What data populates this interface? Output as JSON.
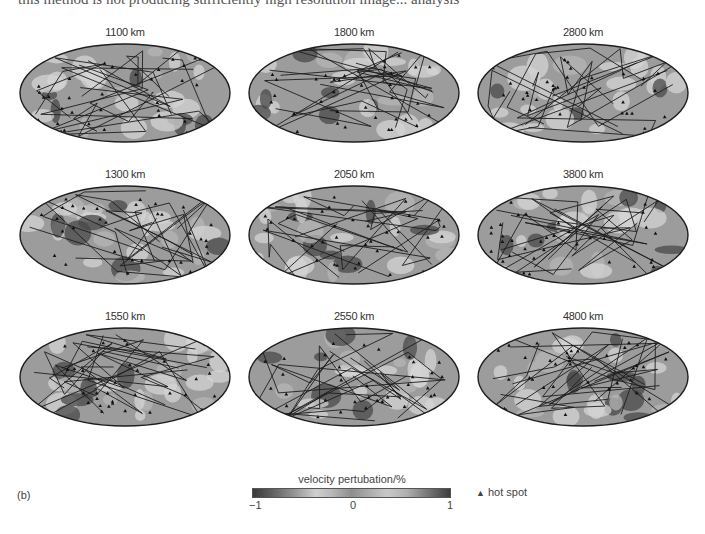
{
  "top_text": "this method is not producing sufficiently high resolution image... analysis",
  "panels": [
    {
      "label": "1100 km",
      "col": 0,
      "row": 0
    },
    {
      "label": "1800 km",
      "col": 1,
      "row": 0
    },
    {
      "label": "2800 km",
      "col": 2,
      "row": 0
    },
    {
      "label": "1300 km",
      "col": 0,
      "row": 1
    },
    {
      "label": "2050 km",
      "col": 1,
      "row": 1
    },
    {
      "label": "3800 km",
      "col": 2,
      "row": 1
    },
    {
      "label": "1550 km",
      "col": 0,
      "row": 2
    },
    {
      "label": "2550 km",
      "col": 1,
      "row": 2
    },
    {
      "label": "4800 km",
      "col": 2,
      "row": 2
    }
  ],
  "figure_label": "(b)",
  "colorbar": {
    "title": "velocity pertubation/%",
    "ticks": [
      "−1",
      "0",
      "1"
    ],
    "min": -1,
    "max": 1
  },
  "legend": {
    "symbol": "▲",
    "label": "hot spot"
  },
  "colors": {
    "map_base": "#9c9c9c",
    "map_dark": "#4a4a4a",
    "map_light": "#d4d4d4",
    "outline": "#1e1e1e"
  }
}
